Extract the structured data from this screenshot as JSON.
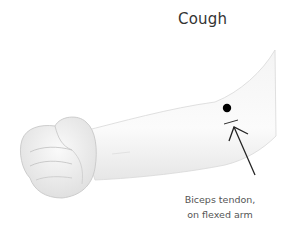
{
  "title": "Cough",
  "caption": {
    "line1": "Biceps tendon,",
    "line2": "on flexed arm"
  },
  "illustration": {
    "subject": "flexed arm with clenched fist",
    "point_color": "#000000",
    "arrow_color": "#222222",
    "skin_color": "#f2f2f2"
  }
}
